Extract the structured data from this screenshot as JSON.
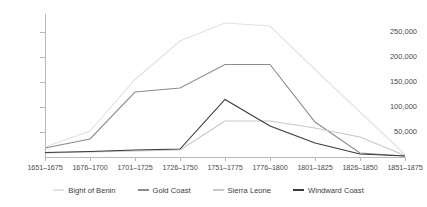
{
  "chart_data": {
    "type": "line",
    "title": "",
    "subtitle": "",
    "xlabel": "",
    "ylabel": "",
    "grid": false,
    "legend_position": "bottom",
    "categories": [
      "1651–1675",
      "1676–1700",
      "1701–1725",
      "1726–1750",
      "1751–1775",
      "1776–1800",
      "1801–1825",
      "1826–1850",
      "1851–1875"
    ],
    "ylim": [
      0,
      275000
    ],
    "yticks": [
      50000,
      100000,
      150000,
      200000,
      250000
    ],
    "ytick_labels": [
      "50,000",
      "100,000",
      "150,000",
      "200,000",
      "250,000"
    ],
    "series": [
      {
        "name": "Bight of Benin",
        "color": "#e2e2e2",
        "values": [
          20000,
          52000,
          155000,
          232000,
          268000,
          262000,
          175000,
          90000,
          5000
        ]
      },
      {
        "name": "Gold Coast",
        "color": "#8c8c8c",
        "values": [
          18000,
          36000,
          130000,
          138000,
          185000,
          185000,
          70000,
          8000,
          2000
        ]
      },
      {
        "name": "Sierra Leone",
        "color": "#c8c8c8",
        "values": [
          8000,
          10000,
          12000,
          14000,
          72000,
          72000,
          58000,
          40000,
          3000
        ]
      },
      {
        "name": "Windward Coast",
        "color": "#3a3a3a",
        "values": [
          9000,
          11000,
          14000,
          16000,
          115000,
          62000,
          28000,
          6000,
          2000
        ]
      }
    ]
  },
  "legend": {
    "items": [
      {
        "label": "Bight of Benin",
        "color": "#e2e2e2",
        "name": "legend-item-bight-of-benin"
      },
      {
        "label": "Gold Coast",
        "color": "#8c8c8c",
        "name": "legend-item-gold-coast"
      },
      {
        "label": "Sierra Leone",
        "color": "#c8c8c8",
        "name": "legend-item-sierra-leone"
      },
      {
        "label": "Windward Coast",
        "color": "#3a3a3a",
        "name": "legend-item-windward-coast"
      }
    ]
  }
}
